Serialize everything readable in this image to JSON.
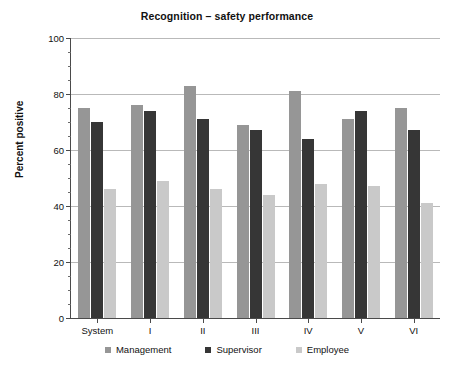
{
  "chart_data": {
    "type": "bar",
    "title": "Recognition – safety performance",
    "xlabel": "",
    "ylabel": "Percent positive",
    "ylim": [
      0,
      100
    ],
    "ytick_labels": [
      "0",
      "20",
      "40",
      "60",
      "80",
      "100"
    ],
    "ytick_values": [
      0,
      20,
      40,
      60,
      80,
      100
    ],
    "yminor_step": 5,
    "grid": "horizontal",
    "legend_position": "bottom",
    "categories": [
      "System",
      "I",
      "II",
      "III",
      "IV",
      "V",
      "VI"
    ],
    "series": [
      {
        "name": "Management",
        "color": "#969696",
        "values": [
          75,
          76,
          83,
          69,
          81,
          71,
          75
        ]
      },
      {
        "name": "Supervisor",
        "color": "#363636",
        "values": [
          70,
          74,
          71,
          67,
          64,
          74,
          67
        ]
      },
      {
        "name": "Employee",
        "color": "#c9c9c9",
        "values": [
          46,
          49,
          46,
          44,
          48,
          47,
          41
        ]
      }
    ]
  }
}
